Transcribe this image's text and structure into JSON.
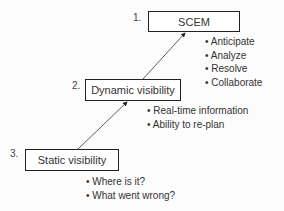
{
  "levels": [
    {
      "number": "1.",
      "title": "SCEM",
      "bullets": [
        "Anticipate",
        "Analyze",
        "Resolve",
        "Collaborate"
      ]
    },
    {
      "number": "2.",
      "title": "Dynamic visibility",
      "bullets": [
        "Real-time information",
        "Ability to re-plan"
      ]
    },
    {
      "number": "3.",
      "title": "Static visibility",
      "bullets": [
        "Where is it?",
        "What went wrong?"
      ]
    }
  ]
}
